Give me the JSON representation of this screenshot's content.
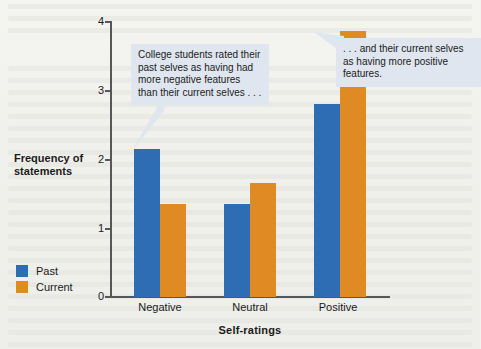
{
  "chart_data": {
    "type": "bar",
    "title": "",
    "subtitle": "",
    "xlabel": "Self-ratings",
    "ylabel": "Frequency of statements",
    "categories": [
      "Negative",
      "Neutral",
      "Positive"
    ],
    "series": [
      {
        "name": "Past",
        "color": "#2E6DB4",
        "values": [
          2.15,
          1.35,
          2.8
        ]
      },
      {
        "name": "Current",
        "color": "#E08A23",
        "values": [
          1.35,
          1.65,
          3.85
        ]
      }
    ],
    "ylim": [
      0,
      4
    ],
    "yticks": [
      0,
      1,
      2,
      3,
      4
    ],
    "ytick_labels": [
      "0",
      "1",
      "2",
      "3",
      "4"
    ],
    "grid": false,
    "legend_position": "bottom-left",
    "annotations": [
      {
        "id": "left",
        "text": "College students rated their past selves as having had more negative features than their current selves . . .",
        "points_to": "Past bar in Negative category"
      },
      {
        "id": "right",
        "text": ". . . and their current selves as having more positive features.",
        "points_to": "Current bar in Positive category"
      }
    ]
  },
  "axis": {
    "y_title_line1": "Frequency of",
    "y_title_line2": "statements",
    "x_title": "Self-ratings"
  },
  "yticks": [
    {
      "label": "4"
    },
    {
      "label": "3"
    },
    {
      "label": "2"
    },
    {
      "label": "1"
    },
    {
      "label": "0"
    }
  ],
  "categories": [
    {
      "label": "Negative"
    },
    {
      "label": "Neutral"
    },
    {
      "label": "Positive"
    }
  ],
  "legend": {
    "items": [
      {
        "label": "Past",
        "color": "#2E6DB4"
      },
      {
        "label": "Current",
        "color": "#E08A23"
      }
    ]
  },
  "callouts": {
    "left": {
      "text": "College students rated their past selves as having had more negative features than their current selves . . ."
    },
    "right": {
      "text": ". . . and their current selves as having more positive features."
    }
  },
  "colors": {
    "past": "#2E6DB4",
    "current": "#E08A23",
    "axis": "#575757",
    "callout_bg": "#dfe6ef",
    "page_bg": "#f2f2ef"
  }
}
